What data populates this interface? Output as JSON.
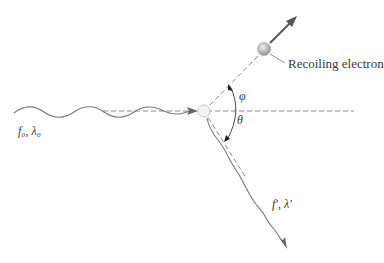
{
  "diagram": {
    "type": "compton-scattering",
    "labels": {
      "recoiling_electron": "Recoiling electron",
      "incident_photon": "f₀, λ₀",
      "scattered_photon": "f′, λ′",
      "phi": "φ",
      "theta": "θ"
    },
    "colors": {
      "line": "#7a7a7a",
      "dashed": "#8a8a8a",
      "arrow": "#666666",
      "electron_fill": "#bdbdbd",
      "target_fill": "#f4f4f4",
      "text": "#3a3a3a"
    }
  }
}
